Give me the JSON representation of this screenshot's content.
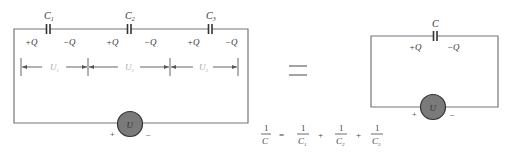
{
  "series_circuit": {
    "capacitors": [
      {
        "label": "C",
        "sub": "1",
        "plus": "+Q",
        "minus": "−Q"
      },
      {
        "label": "C",
        "sub": "2",
        "plus": "+Q",
        "minus": "−Q"
      },
      {
        "label": "C",
        "sub": "3",
        "plus": "+Q",
        "minus": "−Q"
      }
    ],
    "voltages": [
      {
        "label": "U",
        "sub": "1"
      },
      {
        "label": "U",
        "sub": "2"
      },
      {
        "label": "U",
        "sub": "3"
      }
    ],
    "source": {
      "label": "U",
      "plus": "+",
      "minus": "–",
      "fill": "#7a7a7a"
    }
  },
  "equals_sign": "=",
  "equivalent_circuit": {
    "capacitor": {
      "label": "C",
      "plus": "+Q",
      "minus": "−Q"
    },
    "source": {
      "label": "U",
      "plus": "+",
      "minus": "–",
      "fill": "#7a7a7a"
    }
  },
  "formula": {
    "lhs": {
      "num": "1",
      "den": "C"
    },
    "eq": "=",
    "terms": [
      {
        "num": "1",
        "den": "C",
        "sub": "1"
      },
      {
        "num": "1",
        "den": "C",
        "sub": "2"
      },
      {
        "num": "1",
        "den": "C",
        "sub": "3"
      }
    ],
    "op": "+"
  }
}
